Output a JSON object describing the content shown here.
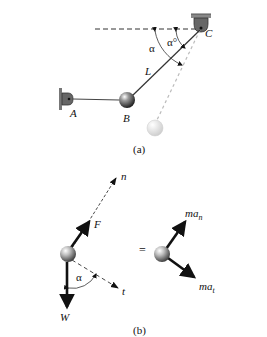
{
  "figure_a": {
    "caption": "(a)",
    "labels": {
      "A": "A",
      "B": "B",
      "C": "C",
      "L": "L",
      "alpha": "α",
      "alpha0": "α°"
    }
  },
  "figure_b": {
    "caption": "(b)",
    "labels": {
      "n": "n",
      "t": "t",
      "F": "F",
      "W": "W",
      "alpha": "α",
      "equals": "=",
      "ma_n_main": "ma",
      "ma_n_sub": "n",
      "ma_t_main": "ma",
      "ma_t_sub": "t"
    }
  },
  "colors": {
    "line": "#1a1a1a",
    "dashed": "#333333",
    "faded": "#bbbbbb",
    "support": "#555555"
  }
}
